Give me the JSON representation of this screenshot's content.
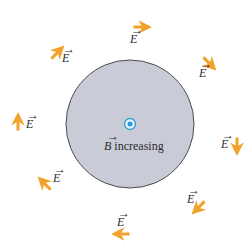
{
  "diagram": {
    "background": "#ffffff",
    "region": {
      "shape": "circle",
      "fill": "#c9cbd6",
      "stroke": "#4a4a55",
      "label_symbol": "B",
      "label_text": " increasing",
      "field_direction_symbol": "dot (out of page)",
      "dot_color": "#2e9bd6"
    },
    "arrow_color": "#f0a22a",
    "field_label": "E",
    "field_vectors": [
      {
        "id": "top",
        "x": 140,
        "y": 27,
        "angle": 0,
        "label_x": 130,
        "label_y": 43
      },
      {
        "id": "top-right",
        "x": 208,
        "y": 62,
        "angle": 45,
        "label_x": 199,
        "label_y": 77
      },
      {
        "id": "right",
        "x": 237,
        "y": 144,
        "angle": 90,
        "label_x": 221,
        "label_y": 148
      },
      {
        "id": "bottom-right",
        "x": 200,
        "y": 206,
        "angle": 135,
        "label_x": 187,
        "label_y": 203
      },
      {
        "id": "bottom",
        "x": 123,
        "y": 234,
        "angle": 180,
        "label_x": 117,
        "label_y": 226
      },
      {
        "id": "bottom-left",
        "x": 46,
        "y": 185,
        "angle": 225,
        "label_x": 53,
        "label_y": 182
      },
      {
        "id": "left",
        "x": 18,
        "y": 124,
        "angle": 270,
        "label_x": 26,
        "label_y": 128
      },
      {
        "id": "top-left",
        "x": 56,
        "y": 54,
        "angle": 315,
        "label_x": 62,
        "label_y": 62
      }
    ]
  }
}
